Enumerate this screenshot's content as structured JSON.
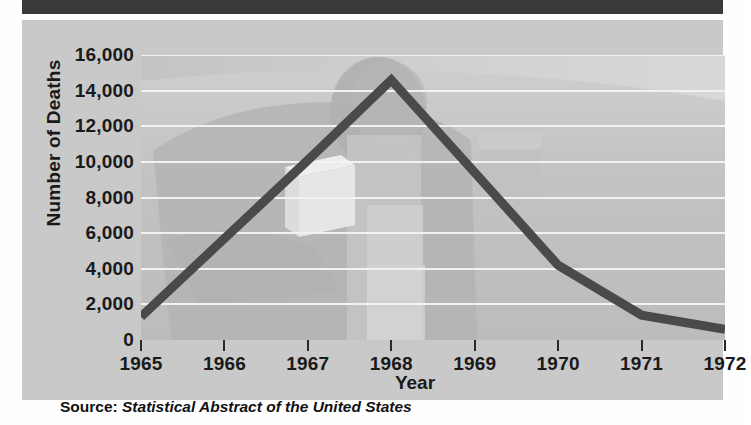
{
  "chart_data": {
    "type": "line",
    "title": "",
    "xlabel": "Year",
    "ylabel": "Number of Deaths",
    "x": [
      1965,
      1966,
      1967,
      1968,
      1969,
      1970,
      1971,
      1972
    ],
    "categories": [
      "1965",
      "1966",
      "1967",
      "1968",
      "1969",
      "1970",
      "1971",
      "1972"
    ],
    "values": [
      1300,
      5700,
      10100,
      14600,
      9400,
      4200,
      1400,
      600
    ],
    "series": [
      {
        "name": "Number of Deaths",
        "values": [
          1300,
          5700,
          10100,
          14600,
          9400,
          4200,
          1400,
          600
        ]
      }
    ],
    "ylim": [
      0,
      16000
    ],
    "xlim": [
      1965,
      1972
    ],
    "yticks": [
      0,
      2000,
      4000,
      6000,
      8000,
      10000,
      12000,
      14000,
      16000
    ],
    "ytick_labels": [
      "0",
      "2,000",
      "4,000",
      "6,000",
      "8,000",
      "10,000",
      "12,000",
      "14,000",
      "16,000"
    ],
    "xtick_labels": [
      "1965",
      "1966",
      "1967",
      "1968",
      "1969",
      "1970",
      "1971",
      "1972"
    ],
    "grid": "horizontal",
    "legend": "none",
    "line_color": "#4a4a4a",
    "plot_background": "#bdbdbd",
    "gridline_color": "#f2f2f2"
  },
  "axes": {
    "y_axis_title": "Number of Deaths",
    "x_axis_title": "Year",
    "y_tick_labels": [
      "16,000",
      "14,000",
      "12,000",
      "10,000",
      "8,000",
      "6,000",
      "4,000",
      "2,000",
      "0"
    ],
    "x_tick_labels": [
      "1965",
      "1966",
      "1967",
      "1968",
      "1969",
      "1970",
      "1971",
      "1972"
    ]
  },
  "source": {
    "prefix": "Source:",
    "title": "Statistical Abstract of the United States"
  },
  "colors": {
    "header_bar": "#3a3a3a",
    "card": "#c9c9c9",
    "plot": "#bdbdbd",
    "line": "#4a4a4a",
    "gridline": "#f2f2f2",
    "text": "#1a1a1a"
  }
}
